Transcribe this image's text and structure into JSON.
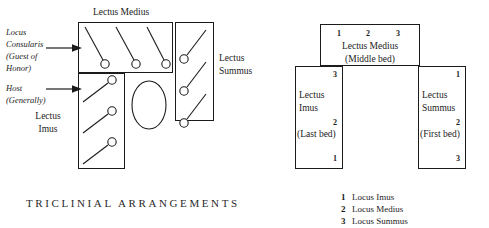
{
  "title": "TRICLINIAL ARRANGEMENTS",
  "left_diagram": {
    "name": "pictorial-triclinium",
    "top_couch_label": "Lectus Medius",
    "right_couch_label_line1": "Lectus",
    "right_couch_label_line2": "Summus",
    "left_couch_label_line1": "Lectus",
    "left_couch_label_line2": "Imus",
    "annotations": [
      {
        "lines": [
          "Locus",
          "Consularis",
          "(Guest of",
          "Honor)"
        ]
      },
      {
        "lines": [
          "Host",
          "(Generally)"
        ]
      }
    ],
    "table_shape": "oval-table"
  },
  "right_diagram": {
    "name": "schematic-triclinium",
    "middle_bed": {
      "numbers": [
        "1",
        "2",
        "3"
      ],
      "label": "Lectus Medius",
      "sublabel": "(Middle bed)"
    },
    "left_bed": {
      "label_line1": "Lectus",
      "label_line2": "Imus",
      "sublabel": "(Last  bed)",
      "numbers": [
        "3",
        "2",
        "1"
      ]
    },
    "right_bed": {
      "label_line1": "Lectus",
      "label_line2": "Summus",
      "sublabel": "(First bed)",
      "numbers": [
        "1",
        "2",
        "3"
      ]
    }
  },
  "legend": [
    {
      "num": "1",
      "text": "Locus Imus"
    },
    {
      "num": "2",
      "text": "Locus Medius"
    },
    {
      "num": "3",
      "text": "Locus Summus"
    }
  ],
  "colors": {
    "ink": "#1b1b1b",
    "paper": "#ffffff"
  }
}
